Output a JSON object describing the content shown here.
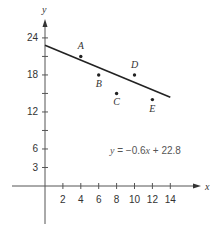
{
  "chart_data": {
    "type": "scatter",
    "title": "",
    "xlabel": "x",
    "ylabel": "y",
    "xlim": [
      -4,
      17
    ],
    "ylim": [
      -8,
      27
    ],
    "xticks": [
      2,
      4,
      6,
      8,
      10,
      12,
      14
    ],
    "yticks": [
      3,
      6,
      9,
      12,
      15,
      18,
      21,
      24
    ],
    "ytick_labels": {
      "3": "3",
      "6": "6",
      "12": "12",
      "18": "18",
      "24": "24"
    },
    "grid": false,
    "points": [
      {
        "label": "A",
        "x": 4,
        "y": 21
      },
      {
        "label": "B",
        "x": 6,
        "y": 18
      },
      {
        "label": "C",
        "x": 8,
        "y": 15
      },
      {
        "label": "D",
        "x": 10,
        "y": 18
      },
      {
        "label": "E",
        "x": 12,
        "y": 14
      }
    ],
    "regression_line": {
      "slope": -0.6,
      "intercept": 22.8,
      "x_range": [
        0,
        14
      ]
    },
    "annotations": [
      {
        "text": "y = −0.6x + 22.8",
        "x": 11,
        "y": 7.5
      }
    ]
  },
  "labels": {
    "x_axis": "x",
    "y_axis": "y",
    "equation_y": "y",
    "equation_eq": " = −0.6",
    "equation_x": "x",
    "equation_rest": " + 22.8"
  }
}
